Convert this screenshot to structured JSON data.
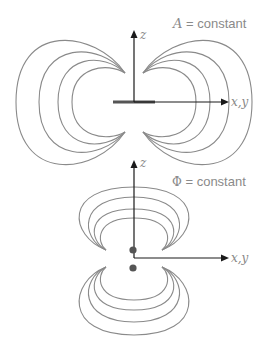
{
  "top_panel": {
    "title_symbol": "A",
    "title_rest": " = constant",
    "axis_vertical_label": "z",
    "axis_horizontal_label": "x,y",
    "source_element": "line-segment",
    "contour_count_per_side": 4
  },
  "bottom_panel": {
    "title_symbol": "Φ",
    "title_rest": " = constant",
    "axis_vertical_label": "z",
    "axis_horizontal_label": "x,y",
    "source_elements": [
      "point-charge",
      "point-charge"
    ],
    "contour_count_per_lobe": 4
  },
  "colors": {
    "contour": "#8a8a8a",
    "axis": "#1a1a1a",
    "charge": "#555555",
    "text": "#8a8a8a"
  }
}
